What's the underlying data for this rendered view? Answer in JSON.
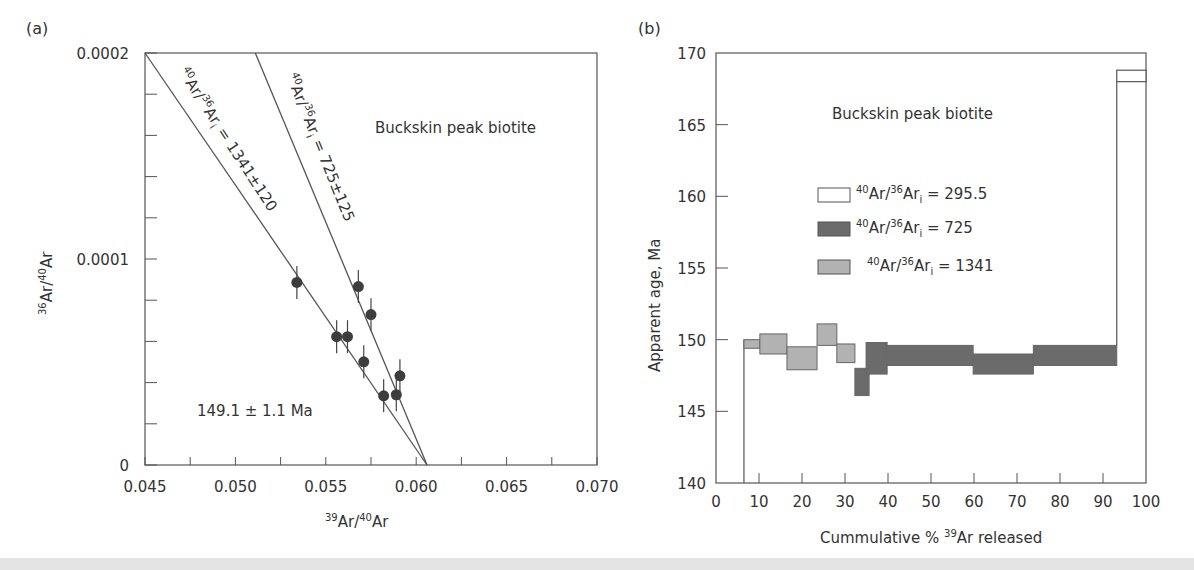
{
  "chart_data": [
    {
      "panel_label": "(a)",
      "type": "scatter",
      "title": "Buckskin peak biotite",
      "xlabel": {
        "sup": "39",
        "base": "Ar/",
        "sup2": "40",
        "base2": "Ar"
      },
      "ylabel": {
        "sup": "36",
        "base": "Ar/",
        "sup2": "40",
        "base2": "Ar"
      },
      "xlim": [
        0.045,
        0.07
      ],
      "ylim": [
        0,
        0.0002
      ],
      "x_ticks": [
        0.045,
        0.05,
        0.055,
        0.06,
        0.065,
        0.07
      ],
      "x_tick_labels": [
        "0.045",
        "0.050",
        "0.055",
        "0.060",
        "0.065",
        "0.070"
      ],
      "x_minor_step": 0.0025,
      "y_ticks": [
        0,
        0.0001,
        0.0002
      ],
      "y_tick_labels": [
        "0",
        "0.0001",
        "0.0002"
      ],
      "y_minor_step": 2e-05,
      "grid": false,
      "points": [
        {
          "x": 0.0534,
          "y": 8.86e-05
        },
        {
          "x": 0.0568,
          "y": 8.66e-05
        },
        {
          "x": 0.0575,
          "y": 7.3e-05
        },
        {
          "x": 0.0556,
          "y": 6.23e-05
        },
        {
          "x": 0.0562,
          "y": 6.23e-05
        },
        {
          "x": 0.0571,
          "y": 5.01e-05
        },
        {
          "x": 0.0591,
          "y": 4.33e-05
        },
        {
          "x": 0.0582,
          "y": 3.36e-05
        },
        {
          "x": 0.0589,
          "y": 3.41e-05
        }
      ],
      "error_bar_y": 8e-06,
      "lines": [
        {
          "name": "isochron-1341",
          "x1": 0.045,
          "y1": 0.0002,
          "x2": 0.0606,
          "y2": 0,
          "label": {
            "sup": "40",
            "base": "Ar/",
            "sup2": "36",
            "base2": "Ar",
            "sub": "i",
            "tail": " = 1341±120"
          }
        },
        {
          "name": "isochron-725",
          "x1": 0.0511,
          "y1": 0.0002,
          "x2": 0.0606,
          "y2": 0,
          "label": {
            "sup": "40",
            "base": "Ar/",
            "sup2": "36",
            "base2": "Ar",
            "sub": "i",
            "tail": " = 725±125"
          }
        }
      ],
      "annotation": "149.1 ± 1.1 Ma"
    },
    {
      "panel_label": "(b)",
      "type": "bar",
      "subtype": "age-spectrum",
      "title": "Buckskin peak biotite",
      "xlabel": {
        "text": "Cummulative % ",
        "sup": "39",
        "tail": "Ar released"
      },
      "ylabel": "Apparent age, Ma",
      "xlim": [
        0,
        100
      ],
      "ylim": [
        140,
        170
      ],
      "x_ticks": [
        0,
        10,
        20,
        30,
        40,
        50,
        60,
        70,
        80,
        90,
        100
      ],
      "x_tick_labels": [
        "0",
        "10",
        "20",
        "30",
        "40",
        "50",
        "60",
        "70",
        "80",
        "90",
        "100"
      ],
      "y_ticks": [
        140,
        145,
        150,
        155,
        160,
        165,
        170
      ],
      "y_tick_labels": [
        "140",
        "145",
        "150",
        "155",
        "160",
        "165",
        "170"
      ],
      "grid": false,
      "legend_position": "center",
      "series": [
        {
          "name": "295.5",
          "color": "#ffffff",
          "label": {
            "sup": "40",
            "base": "Ar/",
            "sup2": "36",
            "base2": "Ar",
            "sub": "i",
            "tail": " = 295.5"
          },
          "steps": [
            {
              "x0": 6.5,
              "x1": 93.2,
              "y_low": 140,
              "y_high": 140,
              "outline_only": true
            },
            {
              "x0": 93.2,
              "x1": 100,
              "y_low": 168.0,
              "y_high": 168.8
            }
          ]
        },
        {
          "name": "725",
          "color": "#6b6b6b",
          "label": {
            "sup": "40",
            "base": "Ar/",
            "sup2": "36",
            "base2": "Ar",
            "sub": "i",
            "tail": " = 725"
          },
          "steps": [
            {
              "x0": 32.3,
              "x1": 35.6,
              "y_low": 146.1,
              "y_high": 148.0
            },
            {
              "x0": 34.9,
              "x1": 39.8,
              "y_low": 147.6,
              "y_high": 149.8
            },
            {
              "x0": 39.8,
              "x1": 59.8,
              "y_low": 148.2,
              "y_high": 149.6
            },
            {
              "x0": 59.8,
              "x1": 73.8,
              "y_low": 147.6,
              "y_high": 149.0
            },
            {
              "x0": 73.8,
              "x1": 93.2,
              "y_low": 148.2,
              "y_high": 149.6
            }
          ]
        },
        {
          "name": "1341",
          "color": "#b2b2b2",
          "label": {
            "sup": "40",
            "base": "Ar/",
            "sup2": "36",
            "base2": "Ar",
            "sub": "i",
            "tail": " = 1341"
          },
          "steps": [
            {
              "x0": 6.5,
              "x1": 10.2,
              "y_low": 149.4,
              "y_high": 150.0
            },
            {
              "x0": 10.2,
              "x1": 16.5,
              "y_low": 149.0,
              "y_high": 150.4
            },
            {
              "x0": 16.5,
              "x1": 23.5,
              "y_low": 147.9,
              "y_high": 149.5
            },
            {
              "x0": 23.5,
              "x1": 28.1,
              "y_low": 149.6,
              "y_high": 151.1
            },
            {
              "x0": 28.1,
              "x1": 32.3,
              "y_low": 148.4,
              "y_high": 149.7
            }
          ]
        }
      ]
    }
  ]
}
